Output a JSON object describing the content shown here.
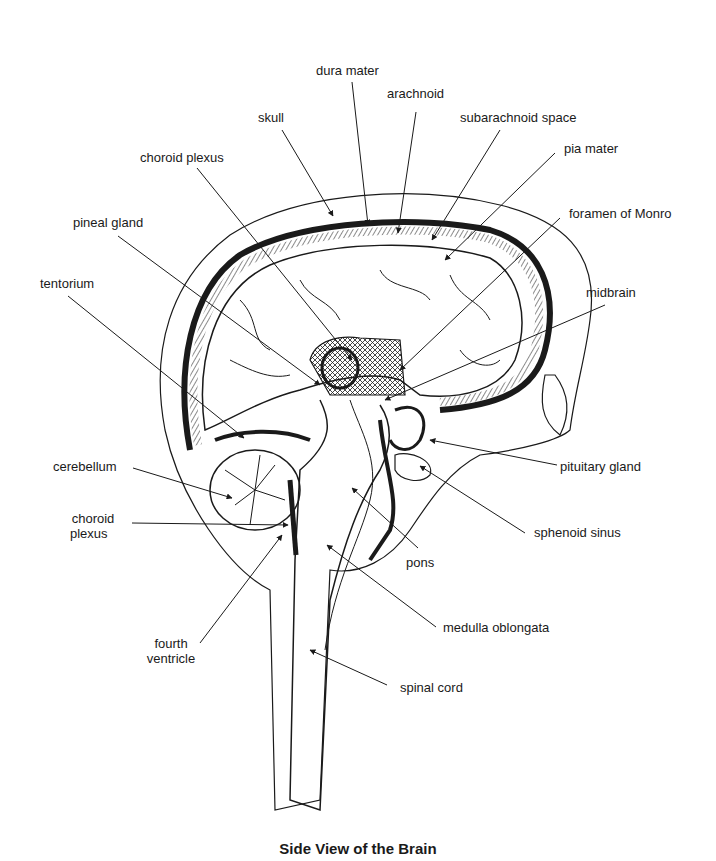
{
  "diagram": {
    "caption": "Side View of the Brain",
    "labels": {
      "dura_mater": "dura mater",
      "arachnoid": "arachnoid",
      "skull": "skull",
      "subarachnoid_space": "subarachnoid space",
      "pia_mater": "pia mater",
      "choroid_plexus_top": "choroid plexus",
      "foramen_of_monro": "foramen of Monro",
      "pineal_gland": "pineal gland",
      "tentorium": "tentorium",
      "midbrain": "midbrain",
      "cerebellum": "cerebellum",
      "choroid_plexus_side_line1": "choroid",
      "choroid_plexus_side_line2": "plexus",
      "pituitary_gland": "pituitary gland",
      "sphenoid_sinus": "sphenoid sinus",
      "pons": "pons",
      "fourth_ventricle_line1": "fourth",
      "fourth_ventricle_line2": "ventricle",
      "medulla_oblongata": "medulla oblongata",
      "spinal_cord": "spinal cord"
    },
    "colors": {
      "ink": "#1a1a1a",
      "background": "#ffffff"
    }
  }
}
